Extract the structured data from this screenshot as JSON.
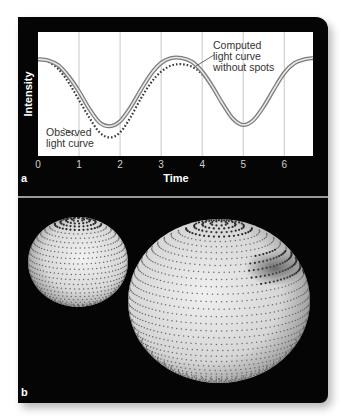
{
  "figure": {
    "panel_a_label": "a",
    "panel_b_label": "b"
  },
  "chart_data": {
    "type": "line",
    "title": "",
    "xlabel": "Time",
    "ylabel": "Intensity",
    "xlim": [
      0,
      6.7
    ],
    "ylim": [
      0,
      1
    ],
    "x_ticks": [
      "0",
      "1",
      "2",
      "3",
      "4",
      "5",
      "6"
    ],
    "grid": "vertical lines at each integer time",
    "legend_position": "inline annotations",
    "x": [
      0,
      0.25,
      0.5,
      0.75,
      1.0,
      1.25,
      1.5,
      1.75,
      2.0,
      2.25,
      2.5,
      2.75,
      3.0,
      3.25,
      3.5,
      3.75,
      4.0,
      4.25,
      4.5,
      4.75,
      5.0,
      5.25,
      5.5,
      5.75,
      6.0,
      6.25,
      6.5,
      6.7
    ],
    "series": [
      {
        "name": "Computed light curve without spots",
        "style": "solid gray double-line",
        "values": [
          0.78,
          0.77,
          0.73,
          0.64,
          0.52,
          0.38,
          0.27,
          0.24,
          0.28,
          0.39,
          0.53,
          0.66,
          0.75,
          0.79,
          0.79,
          0.76,
          0.68,
          0.56,
          0.42,
          0.3,
          0.25,
          0.29,
          0.4,
          0.54,
          0.67,
          0.75,
          0.78,
          0.79
        ]
      },
      {
        "name": "Observed light curve",
        "style": "dotted",
        "values": [
          0.78,
          0.76,
          0.7,
          0.59,
          0.45,
          0.31,
          0.19,
          0.15,
          0.19,
          0.31,
          0.46,
          0.59,
          0.68,
          0.73,
          0.74,
          0.72,
          0.66,
          0.55,
          0.42,
          0.3,
          0.25,
          0.29,
          0.4,
          0.54,
          0.67,
          0.75,
          0.78,
          0.79
        ]
      }
    ],
    "annotations": [
      {
        "text": "Computed light curve without spots",
        "lines": [
          "Computed",
          "light curve",
          "without spots"
        ]
      },
      {
        "text": "Observed light curve",
        "lines": [
          "Observed",
          "light curve"
        ]
      }
    ]
  },
  "diagram": {
    "objects": [
      "small-star",
      "large-star",
      "starspot-region"
    ]
  },
  "colors": {
    "frame": "#050505",
    "plot_bg": "#ffffff",
    "gridline": "#c8c8c8",
    "computed_curve": "#8a8a8a",
    "observed_curve": "#3a3a3a",
    "separator": "#9a9a9a",
    "sphere_light": "#e6e6e6",
    "sphere_dark": "#7a7a7a"
  }
}
